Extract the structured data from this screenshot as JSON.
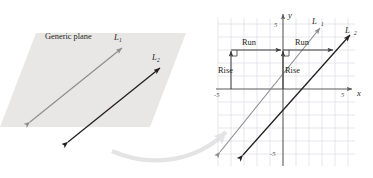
{
  "figure": {
    "colors": {
      "plane_fill": "#e8e7e6",
      "line1": "#8d8d8f",
      "line2": "#231f20",
      "grid": "#d3d3e0",
      "axis": "#5a5a5a",
      "curved_arrow": "#e2e2e2",
      "text": "#231f20",
      "tick_text": "#4a4a4a"
    }
  },
  "left_panel": {
    "name": "generic-plane-panel",
    "plane_label": "Generic plane",
    "line1": {
      "label_base": "L",
      "label_sub": "1",
      "color": "#8d8d8f",
      "style": "double-headed-arrow"
    },
    "line2": {
      "label_base": "L",
      "label_sub": "2",
      "color": "#231f20",
      "style": "double-headed-arrow"
    }
  },
  "transition": {
    "name": "curved-arrow",
    "description": "curved arrow pointing from generic plane to coordinate plane"
  },
  "right_panel": {
    "name": "coordinate-plane-panel",
    "axes": {
      "x_label": "x",
      "y_label": "y",
      "x_ticks": [
        "-5",
        "5"
      ],
      "y_ticks": [
        "5",
        "-5"
      ],
      "xlim": [
        -6,
        6
      ],
      "ylim": [
        -6,
        6
      ],
      "grid": true
    },
    "line1": {
      "label_base": "L",
      "label_sub": "1",
      "color": "#8d8d8f",
      "slope_desc": "rise over run",
      "rise_label": "Rise",
      "run_label": "Run"
    },
    "line2": {
      "label_base": "L",
      "label_sub": "2",
      "color": "#231f20",
      "slope_desc": "rise over run",
      "rise_label": "Rise",
      "run_label": "Run"
    }
  },
  "chart_data": {
    "type": "line",
    "xlabel": "x",
    "ylabel": "y",
    "xlim": [
      -6,
      6
    ],
    "ylim": [
      -6,
      6
    ],
    "grid": true,
    "x_tick_labels": [
      "-5",
      "5"
    ],
    "y_tick_labels": [
      "5",
      "-5"
    ],
    "series": [
      {
        "name": "L1",
        "color": "#8d8d8f",
        "slope": 1,
        "intercept": 0,
        "points": [
          [
            -5,
            -5
          ],
          [
            3,
            3
          ]
        ],
        "rise": 3,
        "run": 3,
        "rise_label": "Rise",
        "run_label": "Run",
        "rise_segment": [
          [
            -3,
            -3
          ],
          [
            -3,
            0
          ]
        ],
        "run_segment": [
          [
            -3,
            0
          ],
          [
            0,
            0
          ]
        ]
      },
      {
        "name": "L2",
        "color": "#231f20",
        "slope": 1,
        "intercept": -3,
        "points": [
          [
            -2,
            -5
          ],
          [
            5,
            2
          ]
        ],
        "rise": 3,
        "run": 3,
        "rise_label": "Rise",
        "run_label": "Run",
        "rise_segment": [
          [
            0,
            -3
          ],
          [
            0,
            0
          ]
        ],
        "run_segment": [
          [
            0,
            0
          ],
          [
            3,
            0
          ]
        ]
      }
    ]
  }
}
